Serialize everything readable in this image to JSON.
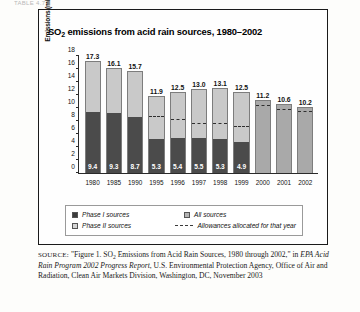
{
  "page": {
    "header_strip": "TABLE 4.7"
  },
  "figure": {
    "title_prefix": "SO",
    "title_sub": "2",
    "title_rest": " emissions from acid rain sources, 1980–2002"
  },
  "chart_data": {
    "type": "bar",
    "xlabel": "",
    "ylabel": "Emissions (million tons)",
    "ylim": [
      0,
      18
    ],
    "yticks": [
      0,
      2,
      4,
      6,
      8,
      10,
      12,
      14,
      16,
      18
    ],
    "grid": false,
    "legend_position": "bottom",
    "stacked": true,
    "categories": [
      "1980",
      "1985",
      "1990",
      "1995",
      "1996",
      "1997",
      "1998",
      "1999",
      "2000",
      "2001",
      "2002"
    ],
    "totals": [
      17.3,
      16.1,
      15.7,
      11.9,
      12.5,
      13.0,
      13.1,
      12.5,
      11.2,
      10.6,
      10.2
    ],
    "series": [
      {
        "name": "Phase I sources",
        "values": [
          9.4,
          9.3,
          8.7,
          5.3,
          5.4,
          5.5,
          5.3,
          4.9,
          null,
          null,
          null
        ]
      },
      {
        "name": "Phase II sources",
        "values": [
          7.9,
          6.8,
          7.0,
          6.6,
          7.1,
          7.5,
          7.8,
          7.6,
          null,
          null,
          null
        ]
      },
      {
        "name": "All sources",
        "values": [
          null,
          null,
          null,
          null,
          null,
          null,
          null,
          null,
          11.2,
          10.6,
          10.2
        ]
      }
    ],
    "allowances_allocated": [
      null,
      null,
      null,
      8.7,
      8.3,
      7.7,
      7.6,
      7.1,
      10.4,
      9.9,
      9.5
    ],
    "bar_labels_inside": [
      "9.4",
      "9.3",
      "8.7",
      "5.3",
      "5.4",
      "5.5",
      "5.3",
      "4.9",
      "",
      "",
      ""
    ],
    "bar_labels_above": [
      "17.3",
      "16.1",
      "15.7",
      "11.9",
      "12.5",
      "13.0",
      "13.1",
      "12.5",
      "11.2",
      "10.6",
      "10.2"
    ]
  },
  "legend": {
    "items": [
      {
        "label": "Phase I sources",
        "swatch": "dark-square-swatch"
      },
      {
        "label": "All sources",
        "swatch": "medium-square-swatch"
      },
      {
        "label": "Phase II sources",
        "swatch": "light-square-swatch"
      },
      {
        "label": "Allowances allocated for that year",
        "swatch": "dashed-line-swatch"
      }
    ]
  },
  "source_note": {
    "prefix": "SOURCE:",
    "quoted_a": "\"Figure 1. SO",
    "quoted_sub": "2",
    "quoted_b": " Emissions from Acid Rain Sources, 1980 through 2002,\" in ",
    "italic": "EPA Acid Rain Program 2002 Progress Report",
    "tail": ", U.S. Environmental Protection Agency, Office of Air and Radiation, Clean Air Markets Division, Washington, DC, November 2003"
  },
  "colors": {
    "phase_i": "#4b4b4b",
    "phase_ii": "#c9c9c9",
    "all_sources": "#a9a9a9",
    "allowance_line": "#2f2f2f",
    "frame": "#1a1a1a"
  }
}
